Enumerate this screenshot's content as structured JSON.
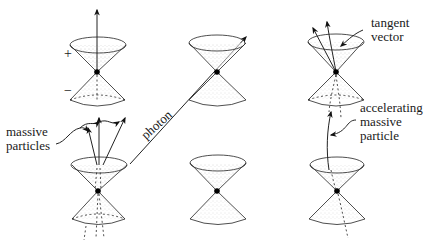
{
  "diagram": {
    "labels": {
      "plus": "+",
      "minus": "−",
      "massive_particles": [
        "massive",
        "particles"
      ],
      "photon": "photon",
      "tangent_vector": [
        "tangent",
        "vector"
      ],
      "accelerating_massive_particle": [
        "accelerating",
        "massive",
        "particle"
      ]
    },
    "cones": [
      {
        "id": "top-left",
        "vertex": [
          97,
          72
        ]
      },
      {
        "id": "bottom-left",
        "vertex": [
          98,
          191
        ]
      },
      {
        "id": "top-middle",
        "vertex": [
          217,
          72
        ]
      },
      {
        "id": "bottom-middle",
        "vertex": [
          217,
          191
        ]
      },
      {
        "id": "top-right",
        "vertex": [
          336,
          72
        ]
      },
      {
        "id": "bottom-right",
        "vertex": [
          337,
          191
        ]
      }
    ],
    "colors": {
      "ink": "#222222",
      "background": "#ffffff"
    }
  }
}
